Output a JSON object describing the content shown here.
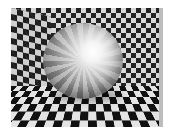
{
  "image": {
    "subject": "raytraced reflective sphere in a checkerboard room",
    "elements": [
      "checkerboard back wall",
      "checkerboard left wall",
      "checkerboard floor",
      "mirror sphere with specular highlight"
    ],
    "colors": {
      "dark_tile": "#1e1e1e",
      "light_tile": "#dcdcdc",
      "highlight": "#ffffff"
    }
  }
}
